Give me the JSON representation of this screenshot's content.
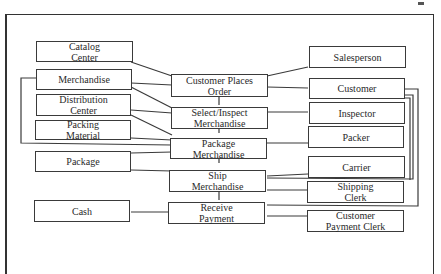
{
  "diagram": {
    "type": "process-resource-agent model",
    "processes": [
      {
        "id": "p1",
        "label": "Customer Places\nOrder"
      },
      {
        "id": "p2",
        "label": "Select/Inspect\nMerchandise"
      },
      {
        "id": "p3",
        "label": "Package\nMerchandise"
      },
      {
        "id": "p4",
        "label": "Ship\nMerchandise"
      },
      {
        "id": "p5",
        "label": "Receive\nPayment"
      }
    ],
    "resources": [
      {
        "id": "r1",
        "label": "Catalog\nCenter"
      },
      {
        "id": "r2",
        "label": "Merchandise"
      },
      {
        "id": "r3",
        "label": "Distribution\nCenter"
      },
      {
        "id": "r4",
        "label": "Packing\nMaterial"
      },
      {
        "id": "r5",
        "label": "Package"
      },
      {
        "id": "r6",
        "label": "Cash"
      }
    ],
    "agents": [
      {
        "id": "a1",
        "label": "Salesperson"
      },
      {
        "id": "a2",
        "label": "Customer"
      },
      {
        "id": "a3",
        "label": "Inspector"
      },
      {
        "id": "a4",
        "label": "Packer"
      },
      {
        "id": "a5",
        "label": "Carrier"
      },
      {
        "id": "a6",
        "label": "Shipping\nClerk"
      },
      {
        "id": "a7",
        "label": "Customer\nPayment Clerk"
      }
    ],
    "connections": [
      [
        "r1",
        "p1"
      ],
      [
        "r2",
        "p1"
      ],
      [
        "r2",
        "p2"
      ],
      [
        "r3",
        "p2"
      ],
      [
        "r3",
        "p3"
      ],
      [
        "r4",
        "p3"
      ],
      [
        "r2",
        "p3"
      ],
      [
        "r5",
        "p3"
      ],
      [
        "r5",
        "p4"
      ],
      [
        "r6",
        "p5"
      ],
      [
        "a1",
        "p1"
      ],
      [
        "a2",
        "p1"
      ],
      [
        "a3",
        "p2"
      ],
      [
        "a4",
        "p3"
      ],
      [
        "a5",
        "p4"
      ],
      [
        "a6",
        "p4"
      ],
      [
        "a7",
        "p5"
      ],
      [
        "a2",
        "p4"
      ],
      [
        "a2",
        "p5"
      ],
      [
        "p1",
        "p2"
      ],
      [
        "p2",
        "p3"
      ],
      [
        "p3",
        "p4"
      ],
      [
        "p4",
        "p5"
      ]
    ]
  }
}
